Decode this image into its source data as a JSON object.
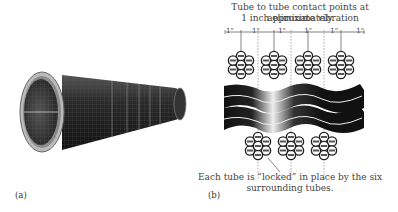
{
  "panel_a": {
    "label": "(a)",
    "figure": "tube-bundle-photo"
  },
  "panel_b": {
    "label": "(b)",
    "top_caption_line1": "Tube to tube contact points at approximately",
    "top_caption_line2": "1 inch eliminate vibration",
    "spacing_labels": [
      "1\"",
      "1\"",
      "1\"",
      "1\"",
      "1\"",
      "1\""
    ],
    "bottom_caption_line1": "Each tube is “locked” in place by the six",
    "bottom_caption_line2": "surrounding tubes."
  }
}
